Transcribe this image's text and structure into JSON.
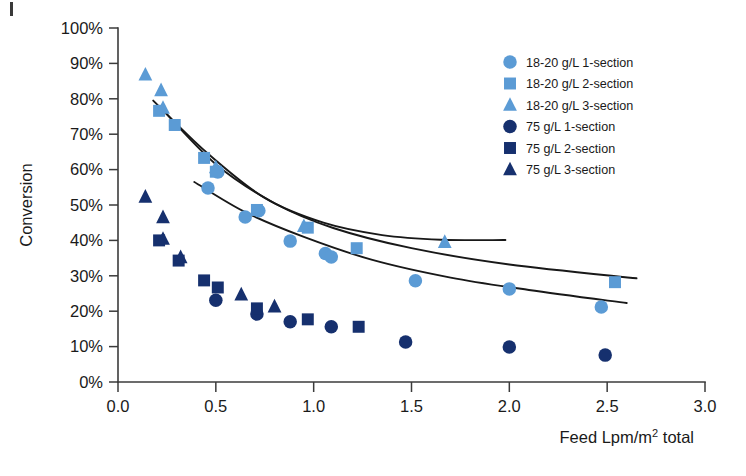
{
  "chart_data": {
    "type": "scatter",
    "title": "",
    "xlabel": "Feed Lpm/m2 total",
    "xlabel_parts": {
      "pre": "Feed Lpm/m",
      "sup": "2",
      "post": " total"
    },
    "ylabel": "Conversion",
    "xlim": [
      0.0,
      3.0
    ],
    "ylim": [
      0,
      100
    ],
    "x_ticks": [
      "0.0",
      "0.5",
      "1.0",
      "1.5",
      "2.0",
      "2.5",
      "3.0"
    ],
    "x_tick_values": [
      0.0,
      0.5,
      1.0,
      1.5,
      2.0,
      2.5,
      3.0
    ],
    "y_ticks": [
      "0%",
      "10%",
      "20%",
      "30%",
      "40%",
      "50%",
      "60%",
      "70%",
      "80%",
      "90%",
      "100%"
    ],
    "y_tick_values": [
      0,
      10,
      20,
      30,
      40,
      50,
      60,
      70,
      80,
      90,
      100
    ],
    "grid": false,
    "legend_position": "upper-right",
    "colors": {
      "light_blue": "#5B9BD5",
      "dark_navy": "#16306E",
      "axis": "#3b3b3b",
      "trend": "#181818",
      "background": "#ffffff"
    },
    "series": [
      {
        "name": "18-20 g/L 1-section",
        "marker": "circle",
        "color": "#5B9BD5",
        "points": [
          [
            0.46,
            54.8
          ],
          [
            0.51,
            59.3
          ],
          [
            0.65,
            46.6
          ],
          [
            0.72,
            48.4
          ],
          [
            0.88,
            39.8
          ],
          [
            1.06,
            36.3
          ],
          [
            1.09,
            35.3
          ],
          [
            1.52,
            28.6
          ],
          [
            2.0,
            26.3
          ],
          [
            2.47,
            21.2
          ]
        ]
      },
      {
        "name": "18-20 g/L 2-section",
        "marker": "square",
        "color": "#5B9BD5",
        "points": [
          [
            0.21,
            76.6
          ],
          [
            0.29,
            72.6
          ],
          [
            0.44,
            63.3
          ],
          [
            0.5,
            59.4
          ],
          [
            0.71,
            48.6
          ],
          [
            0.97,
            43.6
          ],
          [
            1.22,
            37.8
          ],
          [
            2.54,
            28.2
          ]
        ]
      },
      {
        "name": "18-20 g/L 3-section",
        "marker": "triangle",
        "color": "#5B9BD5",
        "points": [
          [
            0.14,
            86.8
          ],
          [
            0.22,
            82.4
          ],
          [
            0.23,
            77.4
          ],
          [
            0.5,
            60.6
          ],
          [
            0.95,
            44.0
          ],
          [
            1.67,
            39.5
          ]
        ]
      },
      {
        "name": "75 g/L 1-section",
        "marker": "circle",
        "color": "#16306E",
        "points": [
          [
            0.5,
            23.1
          ],
          [
            0.71,
            19.2
          ],
          [
            0.88,
            17.0
          ],
          [
            1.09,
            15.6
          ],
          [
            1.47,
            11.3
          ],
          [
            2.0,
            9.9
          ],
          [
            2.49,
            7.6
          ]
        ]
      },
      {
        "name": "75 g/L 2-section",
        "marker": "square",
        "color": "#16306E",
        "points": [
          [
            0.21,
            40.0
          ],
          [
            0.31,
            34.3
          ],
          [
            0.44,
            28.7
          ],
          [
            0.51,
            26.7
          ],
          [
            0.71,
            20.8
          ],
          [
            0.97,
            17.7
          ],
          [
            1.23,
            15.6
          ]
        ]
      },
      {
        "name": "75 g/L 3-section",
        "marker": "triangle",
        "color": "#16306E",
        "points": [
          [
            0.14,
            52.3
          ],
          [
            0.23,
            46.5
          ],
          [
            0.23,
            40.4
          ],
          [
            0.32,
            35.2
          ],
          [
            0.63,
            24.7
          ],
          [
            0.8,
            21.3
          ]
        ]
      }
    ],
    "trend_lines": [
      {
        "name": "trend-3-section",
        "path_points": [
          [
            0.18,
            79.5
          ],
          [
            0.45,
            65.0
          ],
          [
            0.75,
            52.0
          ],
          [
            1.05,
            45.0
          ],
          [
            1.35,
            41.5
          ],
          [
            1.65,
            40.2
          ],
          [
            1.98,
            40.1
          ]
        ]
      },
      {
        "name": "trend-2-section",
        "path_points": [
          [
            0.21,
            78.0
          ],
          [
            0.5,
            61.5
          ],
          [
            0.8,
            50.5
          ],
          [
            1.1,
            43.5
          ],
          [
            1.5,
            37.8
          ],
          [
            2.0,
            33.2
          ],
          [
            2.65,
            29.3
          ]
        ]
      },
      {
        "name": "trend-1-section",
        "path_points": [
          [
            0.39,
            56.5
          ],
          [
            0.65,
            48.0
          ],
          [
            0.95,
            41.0
          ],
          [
            1.3,
            34.5
          ],
          [
            1.7,
            29.5
          ],
          [
            2.1,
            26.0
          ],
          [
            2.6,
            22.3
          ]
        ]
      }
    ],
    "legend": [
      {
        "label": "18-20 g/L 1-section",
        "marker": "circle",
        "color": "#5B9BD5"
      },
      {
        "label": "18-20 g/L 2-section",
        "marker": "square",
        "color": "#5B9BD5"
      },
      {
        "label": "18-20 g/L 3-section",
        "marker": "triangle",
        "color": "#5B9BD5"
      },
      {
        "label": "75 g/L 1-section",
        "marker": "circle",
        "color": "#16306E"
      },
      {
        "label": "75 g/L 2-section",
        "marker": "square",
        "color": "#16306E"
      },
      {
        "label": "75 g/L 3-section",
        "marker": "triangle",
        "color": "#16306E"
      }
    ]
  }
}
